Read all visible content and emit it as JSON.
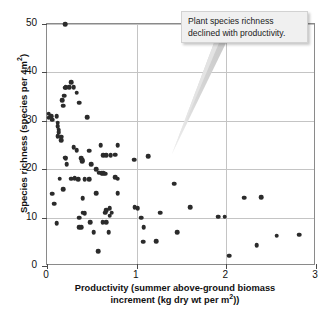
{
  "figure": {
    "background": "#ffffff",
    "point_color": "#2b2b2b",
    "grid_color": "#c4c4c4",
    "frame_color": "#8a8a8a"
  },
  "callout": {
    "name": "annotation-callout",
    "text": "Plant species richness declined with productivity."
  },
  "chart_data": {
    "type": "scatter",
    "title": "",
    "xlabel": "Productivity (summer above-ground biomass increment (kg dry wt per m²))",
    "xlabel_line1": "Productivity (summer above-ground biomass",
    "xlabel_line2_pre": "increment (kg dry wt per m",
    "xlabel_sup": "2",
    "xlabel_line2_post": "))",
    "ylabel": "Species richness (species per 4m²)",
    "ylabel_pre": "Species richness (species per 4m",
    "ylabel_sup": "2",
    "ylabel_post": ")",
    "xlim": [
      0,
      3
    ],
    "ylim": [
      0,
      50
    ],
    "xticks": [
      0,
      1,
      2,
      3
    ],
    "xtick_labels": [
      "0",
      "1",
      "2",
      "3"
    ],
    "yticks": [
      0,
      10,
      20,
      30,
      40,
      50
    ],
    "ytick_labels": [
      "0",
      "10",
      "20",
      "30",
      "40",
      "50"
    ],
    "grid": true,
    "grid_axis": "both",
    "legend": false,
    "marker": "circle",
    "points": [
      [
        0.2,
        50.0
      ],
      [
        0.02,
        31.5
      ],
      [
        0.02,
        30.6
      ],
      [
        0.05,
        31.0
      ],
      [
        0.06,
        30.2
      ],
      [
        0.11,
        30.9
      ],
      [
        0.12,
        29.6
      ],
      [
        0.12,
        28.9
      ],
      [
        0.13,
        28.2
      ],
      [
        0.13,
        27.6
      ],
      [
        0.12,
        26.8
      ],
      [
        0.16,
        26.7
      ],
      [
        0.17,
        34.3
      ],
      [
        0.18,
        33.1
      ],
      [
        0.19,
        35.2
      ],
      [
        0.2,
        36.8
      ],
      [
        0.21,
        36.9
      ],
      [
        0.25,
        37.0
      ],
      [
        0.27,
        38.0
      ],
      [
        0.3,
        36.9
      ],
      [
        0.33,
        35.8
      ],
      [
        0.36,
        33.7
      ],
      [
        0.45,
        30.8
      ],
      [
        0.16,
        26.0
      ],
      [
        0.2,
        22.4
      ],
      [
        0.21,
        22.3
      ],
      [
        0.22,
        21.0
      ],
      [
        0.3,
        24.5
      ],
      [
        0.33,
        23.9
      ],
      [
        0.38,
        22.3
      ],
      [
        0.39,
        21.6
      ],
      [
        0.4,
        21.9
      ],
      [
        0.47,
        23.8
      ],
      [
        0.49,
        21.0
      ],
      [
        0.6,
        24.9
      ],
      [
        0.63,
        22.9
      ],
      [
        0.66,
        22.9
      ],
      [
        0.71,
        22.9
      ],
      [
        0.76,
        23.0
      ],
      [
        0.79,
        24.9
      ],
      [
        0.97,
        22.0
      ],
      [
        1.13,
        22.7
      ],
      [
        0.14,
        18.0
      ],
      [
        0.18,
        15.9
      ],
      [
        0.27,
        18.0
      ],
      [
        0.31,
        18.1
      ],
      [
        0.35,
        17.9
      ],
      [
        0.42,
        17.9
      ],
      [
        0.47,
        17.9
      ],
      [
        0.55,
        20.0
      ],
      [
        0.58,
        19.3
      ],
      [
        0.61,
        19.2
      ],
      [
        0.63,
        19.2
      ],
      [
        0.65,
        19.1
      ],
      [
        0.76,
        18.4
      ],
      [
        0.79,
        18.0
      ],
      [
        0.06,
        14.9
      ],
      [
        0.08,
        12.9
      ],
      [
        0.4,
        14.0
      ],
      [
        0.55,
        15.0
      ],
      [
        0.79,
        15.0
      ],
      [
        1.42,
        17.0
      ],
      [
        1.6,
        12.2
      ],
      [
        2.2,
        14.1
      ],
      [
        2.39,
        14.2
      ],
      [
        0.36,
        10.0
      ],
      [
        0.4,
        11.0
      ],
      [
        0.42,
        10.9
      ],
      [
        0.65,
        11.0
      ],
      [
        0.66,
        11.5
      ],
      [
        0.7,
        12.0
      ],
      [
        0.72,
        11.0
      ],
      [
        0.7,
        10.4
      ],
      [
        0.98,
        12.1
      ],
      [
        1.01,
        11.9
      ],
      [
        1.05,
        10.0
      ],
      [
        1.26,
        11.0
      ],
      [
        1.91,
        10.2
      ],
      [
        1.98,
        10.2
      ],
      [
        0.11,
        8.8
      ],
      [
        0.36,
        8.0
      ],
      [
        0.38,
        8.0
      ],
      [
        0.48,
        9.0
      ],
      [
        0.62,
        9.0
      ],
      [
        0.66,
        9.0
      ],
      [
        0.69,
        7.0
      ],
      [
        0.52,
        7.0
      ],
      [
        1.08,
        8.0
      ],
      [
        1.45,
        7.0
      ],
      [
        1.07,
        5.0
      ],
      [
        1.22,
        5.1
      ],
      [
        2.03,
        2.1
      ],
      [
        2.34,
        4.3
      ],
      [
        2.56,
        6.3
      ],
      [
        2.81,
        6.5
      ],
      [
        0.57,
        3.0
      ]
    ]
  }
}
